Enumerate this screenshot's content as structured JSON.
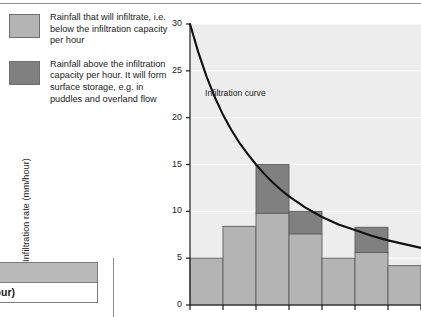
{
  "legend": {
    "items": [
      {
        "swatch": "light",
        "color": "#b4b4b4",
        "text": "Rainfall that will infiltrate, i.e. below the infiltration capacity per hour"
      },
      {
        "swatch": "dark",
        "color": "#808080",
        "text": "Rainfall above the infiltration capacity per hour. It will form surface storage, e.g. in puddles and overland flow"
      }
    ]
  },
  "mini_table": {
    "header": "uses",
    "row": "ate (mm/hour)"
  },
  "chart_data": {
    "type": "bar",
    "title": "",
    "xlabel": "",
    "ylabel": "Infiltration rate (mm/hour)",
    "ylim": [
      0,
      30
    ],
    "yticks": [
      0,
      5,
      10,
      15,
      20,
      25,
      30
    ],
    "ytick_labels": [
      "0",
      "5",
      "10",
      "15",
      "20",
      "25",
      "30"
    ],
    "grid": true,
    "legend_position": "outside-left",
    "annotations": [
      {
        "text": "Infiltration curve",
        "x": 1.45,
        "y": 22.3
      }
    ],
    "categories": [
      "1",
      "2",
      "3",
      "4",
      "5",
      "6",
      "7"
    ],
    "values": [
      5.0,
      8.4,
      15.0,
      10.0,
      5.0,
      8.3,
      4.2
    ],
    "series": [
      {
        "name": "Rainfall that will infiltrate, i.e. below the infiltration capacity per hour",
        "color": "#b4b4b4",
        "values": [
          5.0,
          8.4,
          9.8,
          7.6,
          5.0,
          5.6,
          4.2
        ]
      },
      {
        "name": "Rainfall above the infiltration capacity per hour. It will form surface storage, e.g. in puddles and overland flow",
        "color": "#808080",
        "values": [
          0.0,
          0.0,
          5.2,
          2.4,
          0.0,
          2.7,
          0.0
        ]
      }
    ],
    "curve": {
      "name": "Infiltration curve",
      "color": "#111111",
      "x": [
        0.0,
        0.25,
        0.5,
        0.75,
        1.0,
        1.25,
        1.5,
        1.75,
        2.0,
        2.25,
        2.5,
        2.75,
        3.0,
        3.5,
        4.0,
        4.5,
        5.0,
        5.5,
        6.0,
        6.5,
        7.0
      ],
      "y": [
        30.0,
        27.0,
        24.4,
        22.2,
        20.3,
        18.7,
        17.3,
        16.1,
        15.0,
        14.0,
        13.1,
        12.3,
        11.6,
        10.4,
        9.4,
        8.6,
        8.0,
        7.4,
        6.9,
        6.5,
        6.1
      ]
    },
    "plot_bg": "#ededed",
    "bar_edge": "#5e5e5e"
  }
}
